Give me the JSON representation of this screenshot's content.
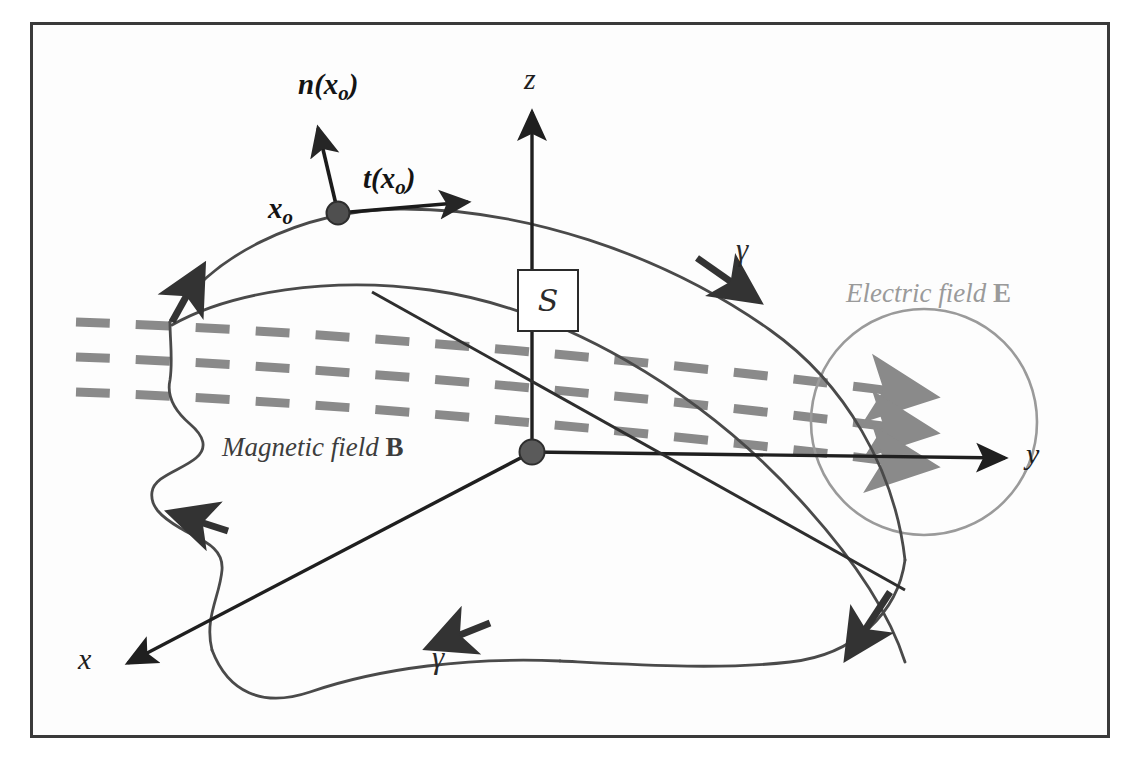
{
  "figure": {
    "frame_color": "#3a3a3a",
    "background": "#ffffff"
  },
  "axes": {
    "x_label": "x",
    "y_label": "y",
    "z_label": "z",
    "origin_marker": "origin-dot",
    "axis_color": "#1f1f1f"
  },
  "surface": {
    "box_letter": "S",
    "box_label_name": "surface-S-box",
    "outline_color": "#4a4a4a"
  },
  "point": {
    "label": "x",
    "subscript": "o",
    "marker": "point-dot",
    "marker_color": "#4f4f4f"
  },
  "vectors": {
    "normal": {
      "symbol": "n",
      "argument": "x",
      "argument_sub": "o",
      "label": "n(xo)"
    },
    "tangent": {
      "symbol": "t",
      "argument": "x",
      "argument_sub": "o",
      "label": "t(xo)"
    }
  },
  "curves": {
    "gamma_symbol": "γ",
    "gamma_upper_name": "gamma-label-upper",
    "gamma_lower_name": "gamma-label-lower",
    "direction_arrows": 5
  },
  "fields": {
    "magnetic": {
      "text": "Magnetic field ",
      "symbol": "B",
      "color": "#3d3d3d",
      "line_style": "dashed",
      "line_count": 3,
      "line_color": "#8a8a8a"
    },
    "electric": {
      "text": "Electric field ",
      "symbol": "E",
      "color": "#9a9a9a",
      "region_shape": "circle",
      "region_color": "#9a9a9a"
    }
  }
}
